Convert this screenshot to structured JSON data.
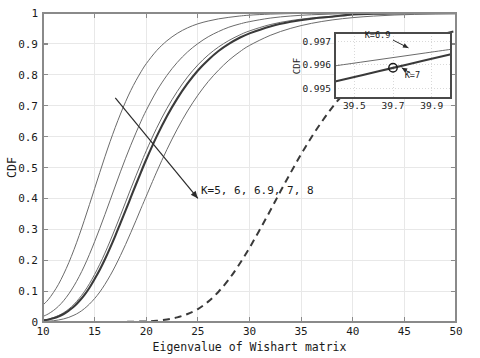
{
  "chart_data": {
    "type": "line",
    "title": "",
    "xlabel": "Eigenvalue of Wishart matrix",
    "ylabel": "CDF",
    "xlim": [
      10,
      50
    ],
    "ylim": [
      0,
      1
    ],
    "xticks": [
      10,
      15,
      20,
      25,
      30,
      35,
      40,
      45,
      50
    ],
    "xtick_labels": [
      "10",
      "15",
      "20",
      "25",
      "30",
      "35",
      "40",
      "45",
      "50"
    ],
    "yticks": [
      0,
      0.1,
      0.2,
      0.3,
      0.4,
      0.5,
      0.6,
      0.7,
      0.8,
      0.9,
      1
    ],
    "ytick_labels": [
      "0",
      "0.1",
      "0.2",
      "0.3",
      "0.4",
      "0.5",
      "0.6",
      "0.7",
      "0.8",
      "0.9",
      "1"
    ],
    "grid": true,
    "legend": "none",
    "annotations": [
      {
        "name": "k-family-label",
        "text": "K=5, 6, 6.9, 7, 8",
        "x": 25.3,
        "y": 0.415,
        "arrow_from": [
          25.0,
          0.4
        ],
        "arrow_to": [
          17.0,
          0.725
        ]
      }
    ],
    "series": [
      {
        "name": "K=5",
        "style": "thin-solid",
        "color": "#6b6b6b",
        "points": [
          [
            10,
            0.055
          ],
          [
            10.5,
            0.072
          ],
          [
            11,
            0.095
          ],
          [
            11.5,
            0.122
          ],
          [
            12,
            0.155
          ],
          [
            12.5,
            0.192
          ],
          [
            13,
            0.234
          ],
          [
            13.5,
            0.28
          ],
          [
            14,
            0.329
          ],
          [
            14.5,
            0.38
          ],
          [
            15,
            0.432
          ],
          [
            15.5,
            0.484
          ],
          [
            16,
            0.535
          ],
          [
            16.5,
            0.584
          ],
          [
            17,
            0.63
          ],
          [
            17.5,
            0.673
          ],
          [
            18,
            0.713
          ],
          [
            18.5,
            0.749
          ],
          [
            19,
            0.781
          ],
          [
            19.5,
            0.81
          ],
          [
            20,
            0.836
          ],
          [
            21,
            0.878
          ],
          [
            22,
            0.91
          ],
          [
            23,
            0.934
          ],
          [
            24,
            0.952
          ],
          [
            25,
            0.965
          ],
          [
            26,
            0.974
          ],
          [
            27,
            0.981
          ],
          [
            28,
            0.986
          ],
          [
            29,
            0.99
          ],
          [
            30,
            0.993
          ],
          [
            32,
            0.9965
          ],
          [
            34,
            0.9982
          ],
          [
            36,
            0.9991
          ],
          [
            40,
            0.9997
          ],
          [
            45,
            0.99995
          ],
          [
            50,
            1.0
          ]
        ]
      },
      {
        "name": "K=6",
        "style": "thin-solid",
        "color": "#6b6b6b",
        "points": [
          [
            10,
            0.018
          ],
          [
            10.5,
            0.026
          ],
          [
            11,
            0.037
          ],
          [
            11.5,
            0.051
          ],
          [
            12,
            0.069
          ],
          [
            12.5,
            0.091
          ],
          [
            13,
            0.117
          ],
          [
            13.5,
            0.147
          ],
          [
            14,
            0.181
          ],
          [
            14.5,
            0.219
          ],
          [
            15,
            0.26
          ],
          [
            15.5,
            0.303
          ],
          [
            16,
            0.348
          ],
          [
            16.5,
            0.394
          ],
          [
            17,
            0.44
          ],
          [
            17.5,
            0.486
          ],
          [
            18,
            0.53
          ],
          [
            18.5,
            0.572
          ],
          [
            19,
            0.612
          ],
          [
            19.5,
            0.65
          ],
          [
            20,
            0.685
          ],
          [
            21,
            0.747
          ],
          [
            22,
            0.798
          ],
          [
            23,
            0.84
          ],
          [
            24,
            0.874
          ],
          [
            25,
            0.901
          ],
          [
            26,
            0.923
          ],
          [
            27,
            0.94
          ],
          [
            28,
            0.954
          ],
          [
            29,
            0.964
          ],
          [
            30,
            0.972
          ],
          [
            32,
            0.9835
          ],
          [
            34,
            0.9903
          ],
          [
            36,
            0.9943
          ],
          [
            38,
            0.9967
          ],
          [
            40,
            0.9981
          ],
          [
            43,
            0.9993
          ],
          [
            46,
            0.99975
          ],
          [
            50,
            0.99995
          ]
        ]
      },
      {
        "name": "K=6.9",
        "style": "thin-solid",
        "color": "#6b6b6b",
        "points": [
          [
            10,
            0.006
          ],
          [
            10.5,
            0.009
          ],
          [
            11,
            0.014
          ],
          [
            11.5,
            0.021
          ],
          [
            12,
            0.03
          ],
          [
            12.5,
            0.042
          ],
          [
            13,
            0.057
          ],
          [
            13.5,
            0.076
          ],
          [
            14,
            0.098
          ],
          [
            14.5,
            0.124
          ],
          [
            15,
            0.154
          ],
          [
            15.5,
            0.187
          ],
          [
            16,
            0.223
          ],
          [
            16.5,
            0.262
          ],
          [
            17,
            0.303
          ],
          [
            17.5,
            0.345
          ],
          [
            18,
            0.388
          ],
          [
            18.5,
            0.431
          ],
          [
            19,
            0.473
          ],
          [
            19.5,
            0.514
          ],
          [
            20,
            0.554
          ],
          [
            21,
            0.627
          ],
          [
            22,
            0.691
          ],
          [
            23,
            0.746
          ],
          [
            24,
            0.793
          ],
          [
            25,
            0.832
          ],
          [
            26,
            0.864
          ],
          [
            27,
            0.89
          ],
          [
            28,
            0.911
          ],
          [
            29,
            0.928
          ],
          [
            30,
            0.942
          ],
          [
            32,
            0.9625
          ],
          [
            34,
            0.9755
          ],
          [
            36,
            0.984
          ],
          [
            38,
            0.9895
          ],
          [
            40,
            0.996
          ],
          [
            42,
            0.99775
          ],
          [
            44,
            0.99865
          ],
          [
            46,
            0.9992
          ],
          [
            50,
            0.99975
          ]
        ]
      },
      {
        "name": "K=7",
        "style": "thick-solid",
        "color": "#3a3a3a",
        "points": [
          [
            10,
            0.005
          ],
          [
            10.5,
            0.0075
          ],
          [
            11,
            0.012
          ],
          [
            11.5,
            0.018
          ],
          [
            12,
            0.026
          ],
          [
            12.5,
            0.037
          ],
          [
            13,
            0.05
          ],
          [
            13.5,
            0.067
          ],
          [
            14,
            0.087
          ],
          [
            14.5,
            0.111
          ],
          [
            15,
            0.139
          ],
          [
            15.5,
            0.169
          ],
          [
            16,
            0.203
          ],
          [
            16.5,
            0.24
          ],
          [
            17,
            0.279
          ],
          [
            17.5,
            0.32
          ],
          [
            18,
            0.361
          ],
          [
            18.5,
            0.403
          ],
          [
            19,
            0.445
          ],
          [
            19.5,
            0.486
          ],
          [
            20,
            0.526
          ],
          [
            21,
            0.6
          ],
          [
            22,
            0.666
          ],
          [
            23,
            0.723
          ],
          [
            24,
            0.772
          ],
          [
            25,
            0.814
          ],
          [
            26,
            0.848
          ],
          [
            27,
            0.877
          ],
          [
            28,
            0.9
          ],
          [
            29,
            0.919
          ],
          [
            30,
            0.934
          ],
          [
            32,
            0.9565
          ],
          [
            34,
            0.9715
          ],
          [
            36,
            0.9815
          ],
          [
            38,
            0.9878
          ],
          [
            40,
            0.9955
          ],
          [
            42,
            0.9974
          ],
          [
            44,
            0.99845
          ],
          [
            46,
            0.99905
          ],
          [
            50,
            0.99965
          ]
        ]
      },
      {
        "name": "K=8",
        "style": "thin-solid",
        "color": "#6b6b6b",
        "points": [
          [
            10,
            0.0015
          ],
          [
            10.5,
            0.0025
          ],
          [
            11,
            0.004
          ],
          [
            11.5,
            0.0065
          ],
          [
            12,
            0.01
          ],
          [
            12.5,
            0.015
          ],
          [
            13,
            0.022
          ],
          [
            13.5,
            0.031
          ],
          [
            14,
            0.043
          ],
          [
            14.5,
            0.058
          ],
          [
            15,
            0.076
          ],
          [
            15.5,
            0.097
          ],
          [
            16,
            0.122
          ],
          [
            16.5,
            0.15
          ],
          [
            17,
            0.181
          ],
          [
            17.5,
            0.215
          ],
          [
            18,
            0.251
          ],
          [
            18.5,
            0.289
          ],
          [
            19,
            0.328
          ],
          [
            19.5,
            0.368
          ],
          [
            20,
            0.407
          ],
          [
            21,
            0.485
          ],
          [
            22,
            0.558
          ],
          [
            23,
            0.624
          ],
          [
            24,
            0.683
          ],
          [
            25,
            0.734
          ],
          [
            26,
            0.778
          ],
          [
            27,
            0.815
          ],
          [
            28,
            0.847
          ],
          [
            29,
            0.873
          ],
          [
            30,
            0.895
          ],
          [
            32,
            0.9275
          ],
          [
            34,
            0.9505
          ],
          [
            36,
            0.9665
          ],
          [
            38,
            0.9775
          ],
          [
            40,
            0.985
          ],
          [
            42,
            0.99
          ],
          [
            44,
            0.9934
          ],
          [
            46,
            0.9956
          ],
          [
            48,
            0.9971
          ],
          [
            50,
            0.9981
          ]
        ]
      },
      {
        "name": "dashed-reference",
        "style": "dashed",
        "color": "#3a3a3a",
        "points": [
          [
            10,
            0.0
          ],
          [
            14,
            0.0
          ],
          [
            18,
            0.0005
          ],
          [
            20,
            0.002
          ],
          [
            21,
            0.004
          ],
          [
            22,
            0.008
          ],
          [
            23,
            0.015
          ],
          [
            24,
            0.026
          ],
          [
            25,
            0.042
          ],
          [
            26,
            0.066
          ],
          [
            27,
            0.098
          ],
          [
            28,
            0.138
          ],
          [
            29,
            0.186
          ],
          [
            30,
            0.24
          ],
          [
            31,
            0.299
          ],
          [
            32,
            0.36
          ],
          [
            33,
            0.423
          ],
          [
            34,
            0.484
          ],
          [
            35,
            0.543
          ],
          [
            36,
            0.598
          ],
          [
            37,
            0.648
          ],
          [
            38,
            0.694
          ],
          [
            39,
            0.734
          ],
          [
            40,
            0.77
          ],
          [
            41,
            0.801
          ],
          [
            42,
            0.828
          ],
          [
            43,
            0.851
          ],
          [
            44,
            0.871
          ],
          [
            45,
            0.888
          ],
          [
            46,
            0.902
          ],
          [
            47,
            0.914
          ],
          [
            48,
            0.925
          ],
          [
            49,
            0.934
          ],
          [
            50,
            0.942
          ]
        ]
      }
    ],
    "inset": {
      "xlabel": "",
      "ylabel": "CDF",
      "xlim": [
        39.4,
        40.0
      ],
      "ylim": [
        0.9946,
        0.99735
      ],
      "xticks": [
        39.5,
        39.7,
        39.9
      ],
      "xtick_labels": [
        "39.5",
        "39.7",
        "39.9"
      ],
      "yticks": [
        0.995,
        0.996,
        0.997
      ],
      "ytick_labels": [
        "0.995",
        "0.996",
        "0.997"
      ],
      "grid": true,
      "annotations": [
        {
          "name": "inset-label-k69",
          "text": "K=6.9",
          "x": 39.62,
          "y": 0.99715,
          "arrow_from": [
            39.7,
            0.99705
          ],
          "arrow_to": [
            39.78,
            0.99672
          ]
        },
        {
          "name": "inset-label-k7",
          "text": "K=7",
          "x": 39.8,
          "y": 0.99545,
          "arrow_from": [
            39.79,
            0.99565
          ],
          "arrow_to": [
            39.745,
            0.99588
          ]
        }
      ],
      "marker": {
        "name": "highlight-marker",
        "x": 39.7,
        "y": 0.99588
      },
      "series": [
        {
          "name": "K=6.9",
          "style": "thin-solid",
          "color": "#6b6b6b",
          "points": [
            [
              39.4,
              0.99596
            ],
            [
              39.55,
              0.996135
            ],
            [
              39.7,
              0.99631
            ],
            [
              39.85,
              0.996485
            ],
            [
              40.0,
              0.99666
            ]
          ]
        },
        {
          "name": "K=7",
          "style": "thick-solid",
          "color": "#3a3a3a",
          "points": [
            [
              39.4,
              0.995295
            ],
            [
              39.55,
              0.995585
            ],
            [
              39.7,
              0.995875
            ],
            [
              39.85,
              0.996165
            ],
            [
              40.0,
              0.996455
            ]
          ]
        }
      ]
    }
  },
  "axes": {
    "xlabel": "Eigenvalue of Wishart matrix",
    "ylabel": "CDF"
  },
  "inset_axes": {
    "ylabel": "CDF"
  }
}
